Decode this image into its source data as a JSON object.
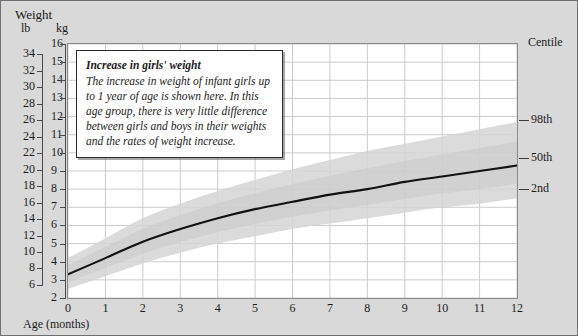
{
  "titles": {
    "weight": "Weight",
    "unit_lb": "lb",
    "unit_kg": "kg",
    "centile": "Centile",
    "xaxis": "Age (months)"
  },
  "callout": {
    "title": "Increase in girls' weight",
    "body": "The increase in weight of infant girls up to 1 year of age is shown here. In this age group, there is very little difference between girls and boys in their weights and the rates of weight increase."
  },
  "colors": {
    "page_background": "#d9d9d9",
    "plot_background": "#ffffff",
    "gridline": "#cccccc",
    "curve": "#111111",
    "band": "#d5d5d5",
    "axis": "#4a4a4a",
    "frame": "#6f6f6f"
  },
  "centile_labels": [
    {
      "label": "98th",
      "kg": 11.8
    },
    {
      "label": "50th",
      "kg": 9.7
    },
    {
      "label": "2nd",
      "kg": 8.0
    }
  ],
  "chart_data": {
    "type": "line",
    "title": "Increase in girls' weight",
    "xlabel": "Age (months)",
    "ylabel": "Weight",
    "xlim": [
      0,
      12
    ],
    "ylim_kg": [
      2,
      16
    ],
    "ylim_lb": [
      6,
      34
    ],
    "grid": true,
    "legend_position": "right",
    "x": [
      0,
      1,
      2,
      3,
      4,
      5,
      6,
      7,
      8,
      9,
      10,
      11,
      12
    ],
    "xticks": [
      "0",
      "1",
      "2",
      "3",
      "4",
      "5",
      "6",
      "7",
      "8",
      "9",
      "10",
      "11",
      "12"
    ],
    "yticks_kg": [
      "2",
      "3",
      "4",
      "5",
      "6",
      "7",
      "8",
      "9",
      "10",
      "11",
      "12",
      "13",
      "14",
      "15",
      "16"
    ],
    "yticks_lb": [
      "6",
      "8",
      "10",
      "12",
      "14",
      "16",
      "18",
      "20",
      "22",
      "24",
      "26",
      "28",
      "30",
      "32",
      "34"
    ],
    "series": [
      {
        "name": "50th",
        "kind": "line",
        "unit": "kg",
        "values": [
          3.3,
          4.2,
          5.1,
          5.8,
          6.4,
          6.9,
          7.3,
          7.7,
          8.0,
          8.4,
          8.7,
          9.0,
          9.3
        ]
      },
      {
        "name": "98th",
        "kind": "band_upper",
        "unit": "kg",
        "values": [
          4.2,
          5.3,
          6.4,
          7.2,
          7.9,
          8.5,
          9.1,
          9.6,
          10.1,
          10.5,
          10.9,
          11.3,
          11.7
        ]
      },
      {
        "name": "2nd",
        "kind": "band_lower",
        "unit": "kg",
        "values": [
          2.5,
          3.2,
          3.9,
          4.5,
          5.0,
          5.4,
          5.8,
          6.1,
          6.4,
          6.7,
          7.0,
          7.2,
          7.5
        ]
      }
    ],
    "annotations": [
      {
        "text": "Increase in girls' weight",
        "role": "callout-title"
      },
      {
        "text": "The increase in weight of infant girls up to 1 year of age is shown here. In this age group, there is very little difference between girls and boys in their weights and the rates of weight increase.",
        "role": "callout-body"
      }
    ]
  }
}
